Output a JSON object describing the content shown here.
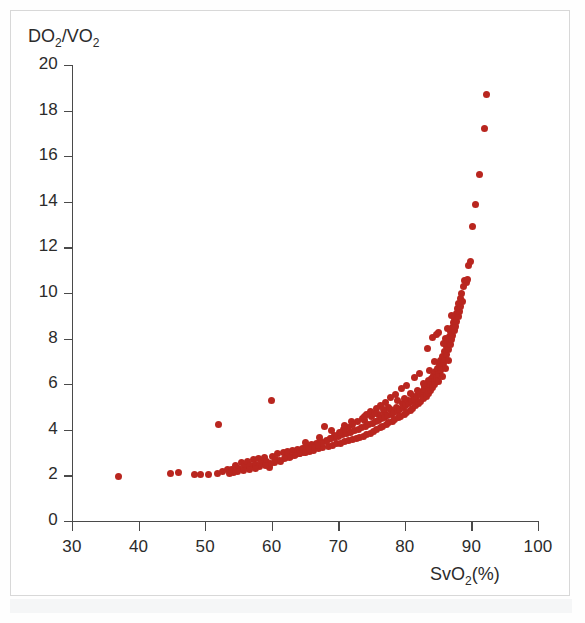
{
  "figure": {
    "background_color": "#ffffff",
    "border_color": "#d8d8d8",
    "point_color": "#b9261f",
    "axis_color": "#4a4a4a"
  },
  "axes": {
    "ylabel_text": "DO",
    "ylabel_sub1": "2",
    "ylabel_mid": "/VO",
    "ylabel_sub2": "2",
    "xlabel_text": "SvO",
    "xlabel_sub": "2",
    "xlabel_suffix": "(%)"
  },
  "chart_data": {
    "type": "scatter",
    "title": "",
    "xlabel": "SvO2(%)",
    "ylabel": "DO2/VO2",
    "xlim": [
      30,
      100
    ],
    "ylim": [
      0,
      20
    ],
    "xticks": [
      30,
      40,
      50,
      60,
      70,
      80,
      90,
      100
    ],
    "yticks": [
      0,
      2,
      4,
      6,
      8,
      10,
      12,
      14,
      16,
      18,
      20
    ],
    "grid": false,
    "legend": null,
    "marker": "circle",
    "marker_color": "#b9261f",
    "marker_size": 7,
    "n_points": 268,
    "points": [
      [
        37.0,
        1.95
      ],
      [
        44.8,
        2.1
      ],
      [
        46.0,
        2.12
      ],
      [
        48.4,
        2.02
      ],
      [
        49.3,
        2.02
      ],
      [
        50.5,
        2.05
      ],
      [
        51.8,
        2.1
      ],
      [
        52.0,
        4.25
      ],
      [
        52.6,
        2.18
      ],
      [
        53.4,
        2.28
      ],
      [
        53.9,
        2.25
      ],
      [
        54.6,
        2.45
      ],
      [
        55.0,
        2.3
      ],
      [
        55.4,
        2.55
      ],
      [
        55.9,
        2.4
      ],
      [
        56.3,
        2.6
      ],
      [
        56.8,
        2.42
      ],
      [
        57.2,
        2.68
      ],
      [
        57.6,
        2.5
      ],
      [
        58.0,
        2.72
      ],
      [
        58.4,
        2.58
      ],
      [
        58.9,
        2.8
      ],
      [
        59.2,
        2.62
      ],
      [
        59.6,
        2.35
      ],
      [
        60.0,
        5.3
      ],
      [
        60.1,
        2.85
      ],
      [
        60.5,
        2.7
      ],
      [
        60.9,
        2.95
      ],
      [
        61.3,
        2.62
      ],
      [
        61.7,
        3.0
      ],
      [
        62.0,
        2.78
      ],
      [
        62.4,
        3.05
      ],
      [
        62.8,
        2.85
      ],
      [
        63.1,
        3.1
      ],
      [
        63.5,
        2.9
      ],
      [
        63.9,
        3.15
      ],
      [
        64.2,
        2.95
      ],
      [
        64.6,
        3.2
      ],
      [
        65.0,
        3.0
      ],
      [
        65.3,
        3.25
      ],
      [
        65.7,
        3.05
      ],
      [
        66.0,
        3.35
      ],
      [
        66.3,
        3.1
      ],
      [
        66.7,
        3.4
      ],
      [
        67.0,
        3.18
      ],
      [
        67.3,
        3.48
      ],
      [
        67.6,
        3.22
      ],
      [
        67.9,
        4.15
      ],
      [
        68.2,
        3.55
      ],
      [
        68.5,
        3.28
      ],
      [
        68.8,
        3.6
      ],
      [
        69.1,
        3.32
      ],
      [
        69.4,
        3.65
      ],
      [
        69.7,
        3.38
      ],
      [
        70.0,
        3.72
      ],
      [
        70.3,
        3.42
      ],
      [
        70.6,
        3.78
      ],
      [
        70.9,
        3.48
      ],
      [
        71.2,
        3.85
      ],
      [
        71.5,
        3.52
      ],
      [
        71.8,
        3.9
      ],
      [
        72.0,
        4.35
      ],
      [
        72.1,
        3.58
      ],
      [
        72.4,
        3.95
      ],
      [
        72.7,
        3.62
      ],
      [
        73.0,
        4.02
      ],
      [
        73.2,
        3.68
      ],
      [
        73.5,
        4.08
      ],
      [
        73.8,
        3.72
      ],
      [
        74.0,
        4.42
      ],
      [
        74.1,
        4.15
      ],
      [
        74.3,
        3.78
      ],
      [
        74.6,
        4.22
      ],
      [
        74.8,
        3.85
      ],
      [
        75.0,
        4.58
      ],
      [
        75.1,
        4.28
      ],
      [
        75.3,
        3.92
      ],
      [
        75.6,
        4.35
      ],
      [
        75.8,
        4.0
      ],
      [
        76.0,
        4.68
      ],
      [
        76.1,
        4.42
      ],
      [
        76.3,
        4.08
      ],
      [
        76.5,
        4.48
      ],
      [
        76.7,
        4.15
      ],
      [
        76.9,
        4.78
      ],
      [
        77.0,
        4.55
      ],
      [
        77.2,
        4.22
      ],
      [
        77.4,
        4.62
      ],
      [
        77.6,
        4.3
      ],
      [
        77.8,
        4.88
      ],
      [
        78.0,
        4.68
      ],
      [
        78.1,
        4.38
      ],
      [
        78.3,
        4.75
      ],
      [
        78.5,
        4.45
      ],
      [
        78.7,
        5.0
      ],
      [
        78.9,
        4.82
      ],
      [
        79.0,
        4.52
      ],
      [
        79.2,
        4.9
      ],
      [
        79.4,
        4.6
      ],
      [
        79.6,
        5.15
      ],
      [
        79.8,
        4.98
      ],
      [
        79.9,
        4.68
      ],
      [
        80.1,
        5.08
      ],
      [
        80.3,
        4.75
      ],
      [
        80.5,
        5.3
      ],
      [
        80.6,
        5.15
      ],
      [
        80.8,
        4.85
      ],
      [
        81.0,
        5.25
      ],
      [
        81.1,
        4.95
      ],
      [
        81.3,
        5.48
      ],
      [
        81.5,
        5.35
      ],
      [
        81.6,
        5.05
      ],
      [
        81.8,
        5.45
      ],
      [
        82.0,
        5.15
      ],
      [
        82.1,
        5.65
      ],
      [
        82.3,
        5.55
      ],
      [
        82.4,
        5.25
      ],
      [
        82.6,
        5.68
      ],
      [
        82.8,
        5.38
      ],
      [
        82.9,
        5.9
      ],
      [
        83.0,
        5.78
      ],
      [
        83.2,
        5.48
      ],
      [
        83.3,
        5.95
      ],
      [
        83.5,
        5.6
      ],
      [
        83.6,
        6.15
      ],
      [
        83.8,
        6.0
      ],
      [
        83.9,
        5.72
      ],
      [
        84.0,
        6.25
      ],
      [
        84.1,
        5.85
      ],
      [
        84.3,
        6.4
      ],
      [
        84.4,
        6.1
      ],
      [
        84.5,
        5.98
      ],
      [
        84.6,
        6.55
      ],
      [
        84.8,
        6.25
      ],
      [
        84.9,
        6.7
      ],
      [
        85.0,
        6.42
      ],
      [
        85.1,
        6.12
      ],
      [
        85.2,
        6.88
      ],
      [
        85.3,
        6.58
      ],
      [
        85.4,
        7.05
      ],
      [
        85.5,
        6.75
      ],
      [
        85.6,
        6.35
      ],
      [
        85.7,
        7.22
      ],
      [
        85.8,
        6.92
      ],
      [
        85.9,
        7.45
      ],
      [
        86.0,
        7.1
      ],
      [
        86.1,
        6.68
      ],
      [
        86.2,
        7.65
      ],
      [
        86.3,
        7.3
      ],
      [
        86.4,
        7.88
      ],
      [
        86.5,
        7.52
      ],
      [
        86.6,
        7.05
      ],
      [
        86.7,
        8.1
      ],
      [
        86.8,
        7.72
      ],
      [
        86.9,
        8.32
      ],
      [
        87.0,
        7.95
      ],
      [
        87.1,
        8.5
      ],
      [
        87.2,
        8.15
      ],
      [
        87.3,
        8.7
      ],
      [
        87.4,
        8.35
      ],
      [
        87.5,
        8.9
      ],
      [
        87.6,
        8.55
      ],
      [
        87.7,
        9.1
      ],
      [
        87.8,
        8.75
      ],
      [
        87.9,
        9.3
      ],
      [
        88.0,
        8.95
      ],
      [
        88.1,
        9.52
      ],
      [
        88.2,
        9.18
      ],
      [
        88.3,
        9.75
      ],
      [
        88.4,
        9.4
      ],
      [
        88.5,
        10.0
      ],
      [
        88.6,
        9.62
      ],
      [
        88.8,
        10.3
      ],
      [
        89.0,
        10.55
      ],
      [
        89.2,
        10.48
      ],
      [
        89.4,
        10.6
      ],
      [
        89.6,
        11.2
      ],
      [
        89.8,
        11.4
      ],
      [
        90.2,
        12.9
      ],
      [
        90.6,
        13.9
      ],
      [
        91.2,
        15.2
      ],
      [
        92.0,
        17.2
      ],
      [
        92.3,
        18.7
      ],
      [
        84.2,
        8.05
      ],
      [
        84.7,
        8.2
      ],
      [
        85.05,
        8.28
      ],
      [
        83.4,
        7.55
      ],
      [
        82.2,
        6.45
      ],
      [
        81.4,
        6.3
      ],
      [
        80.2,
        5.95
      ],
      [
        79.5,
        5.8
      ],
      [
        78.6,
        5.55
      ],
      [
        77.9,
        5.42
      ],
      [
        77.1,
        5.2
      ],
      [
        76.4,
        5.05
      ],
      [
        75.7,
        4.92
      ],
      [
        74.9,
        4.8
      ],
      [
        74.2,
        4.65
      ],
      [
        73.6,
        4.5
      ],
      [
        72.9,
        4.38
      ],
      [
        72.2,
        4.25
      ],
      [
        71.6,
        4.12
      ],
      [
        70.8,
        4.0
      ],
      [
        70.2,
        3.88
      ],
      [
        69.5,
        3.75
      ],
      [
        68.9,
        3.62
      ],
      [
        68.3,
        3.5
      ],
      [
        67.5,
        3.38
      ],
      [
        66.9,
        3.3
      ],
      [
        66.2,
        3.22
      ],
      [
        65.5,
        3.12
      ],
      [
        64.8,
        3.02
      ],
      [
        64.1,
        2.95
      ],
      [
        63.4,
        2.88
      ],
      [
        62.6,
        2.8
      ],
      [
        61.9,
        2.72
      ],
      [
        61.1,
        2.65
      ],
      [
        60.4,
        2.58
      ],
      [
        59.8,
        2.52
      ],
      [
        59.0,
        2.45
      ],
      [
        58.2,
        2.38
      ],
      [
        57.5,
        2.32
      ],
      [
        56.6,
        2.25
      ],
      [
        55.7,
        2.2
      ],
      [
        54.9,
        2.15
      ],
      [
        54.2,
        2.12
      ],
      [
        53.6,
        2.08
      ],
      [
        86.05,
        8.0
      ],
      [
        86.45,
        8.45
      ],
      [
        85.85,
        7.8
      ],
      [
        87.05,
        9.0
      ],
      [
        84.45,
        7.0
      ],
      [
        83.75,
        6.62
      ],
      [
        82.75,
        6.05
      ],
      [
        81.9,
        5.72
      ],
      [
        80.9,
        5.58
      ],
      [
        79.9,
        5.38
      ],
      [
        78.9,
        5.28
      ],
      [
        77.5,
        4.98
      ],
      [
        76.8,
        4.88
      ],
      [
        75.4,
        4.72
      ],
      [
        73.9,
        4.58
      ],
      [
        71.0,
        4.2
      ],
      [
        69.0,
        3.95
      ],
      [
        67.2,
        3.68
      ],
      [
        65.1,
        3.45
      ]
    ]
  }
}
